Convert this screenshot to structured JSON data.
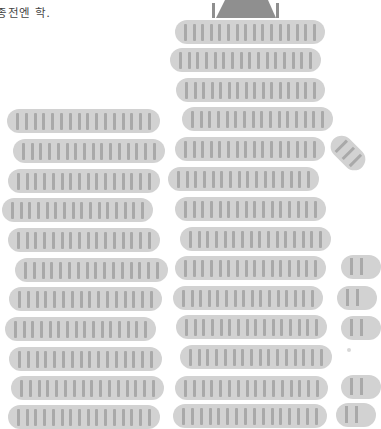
{
  "caption": "종전엔 학.",
  "seatmap": {
    "colors": {
      "block": "#d2d2d2",
      "seat": "#a9a9a9",
      "stage": "#8f8f8f"
    },
    "seats_per_row": 16,
    "stage": {
      "label": "stage"
    },
    "left_section": {
      "rows": [
        {
          "x": 7,
          "y": 109,
          "w": 153
        },
        {
          "x": 13,
          "y": 139,
          "w": 152
        },
        {
          "x": 8,
          "y": 169,
          "w": 152
        },
        {
          "x": 2,
          "y": 198,
          "w": 151
        },
        {
          "x": 8,
          "y": 228,
          "w": 152
        },
        {
          "x": 15,
          "y": 258,
          "w": 153
        },
        {
          "x": 9,
          "y": 287,
          "w": 153
        },
        {
          "x": 5,
          "y": 317,
          "w": 151
        },
        {
          "x": 9,
          "y": 347,
          "w": 153
        },
        {
          "x": 11,
          "y": 376,
          "w": 153
        },
        {
          "x": 8,
          "y": 405,
          "w": 152
        }
      ]
    },
    "center_section": {
      "rows": [
        {
          "x": 175,
          "y": 20,
          "w": 150
        },
        {
          "x": 170,
          "y": 48,
          "w": 151
        },
        {
          "x": 176,
          "y": 78,
          "w": 149
        },
        {
          "x": 182,
          "y": 107,
          "w": 151
        },
        {
          "x": 175,
          "y": 137,
          "w": 150
        },
        {
          "x": 168,
          "y": 167,
          "w": 151
        },
        {
          "x": 175,
          "y": 197,
          "w": 151
        },
        {
          "x": 180,
          "y": 227,
          "w": 151
        },
        {
          "x": 175,
          "y": 256,
          "w": 151
        },
        {
          "x": 173,
          "y": 286,
          "w": 150
        },
        {
          "x": 176,
          "y": 315,
          "w": 151
        },
        {
          "x": 180,
          "y": 345,
          "w": 152
        },
        {
          "x": 175,
          "y": 376,
          "w": 153
        },
        {
          "x": 173,
          "y": 404,
          "w": 154
        }
      ]
    },
    "right_section_partial": {
      "rows": [
        {
          "x": 341,
          "y": 255
        },
        {
          "x": 337,
          "y": 286
        },
        {
          "x": 341,
          "y": 316
        },
        {
          "x": 341,
          "y": 375
        },
        {
          "x": 336,
          "y": 403
        }
      ]
    }
  }
}
